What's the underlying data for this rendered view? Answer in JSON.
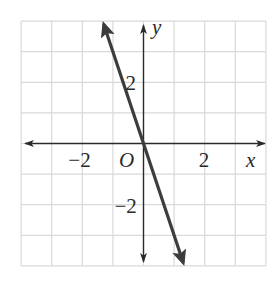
{
  "chart_data": {
    "type": "line",
    "title": "",
    "xlabel": "x",
    "ylabel": "y",
    "origin_label": "O",
    "xlim": [
      -4,
      4
    ],
    "ylim": [
      -4,
      4
    ],
    "grid": true,
    "grid_step": 1,
    "x_ticks": [
      {
        "value": -2,
        "label": "−2"
      },
      {
        "value": 2,
        "label": "2"
      }
    ],
    "y_ticks": [
      {
        "value": 2,
        "label": "2"
      },
      {
        "value": -2,
        "label": "−2"
      }
    ],
    "series": [
      {
        "name": "y = -3x",
        "equation": "y = -3x",
        "slope": -3,
        "intercept": 0,
        "x": [
          -1.3,
          0,
          1.3
        ],
        "y": [
          3.9,
          0,
          -3.9
        ],
        "arrows_both_ends": true
      }
    ]
  },
  "colors": {
    "grid": "#d9d9d9",
    "axis": "#2a2a2a",
    "line": "#3c3c3c",
    "background": "#ffffff"
  }
}
